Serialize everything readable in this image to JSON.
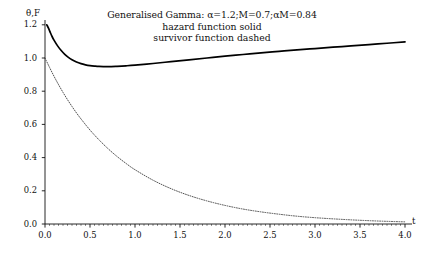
{
  "chart_data": {
    "type": "line",
    "title": "Generalised Gamma: α=1.2;M=0.7;αM=0.84",
    "subtitle_lines": [
      "hazard function solid",
      "survivor function dashed"
    ],
    "xlabel": "t",
    "ylabel": "θ,F",
    "xlim": [
      0.0,
      4.0
    ],
    "ylim": [
      0.0,
      1.2
    ],
    "grid": false,
    "legend_position": "none",
    "xticks": [
      "0.0",
      "0.5",
      "1.0",
      "1.5",
      "2.0",
      "2.5",
      "3.0",
      "3.5",
      "4.0"
    ],
    "xtick_values": [
      0.0,
      0.5,
      1.0,
      1.5,
      2.0,
      2.5,
      3.0,
      3.5,
      4.0
    ],
    "yticks": [
      "0.0",
      "0.2",
      "0.4",
      "0.6",
      "0.8",
      "1.0",
      "1.2"
    ],
    "ytick_values": [
      0.0,
      0.2,
      0.4,
      0.6,
      0.8,
      1.0,
      1.2
    ],
    "parameters": {
      "alpha": 1.2,
      "M": 0.7,
      "alphaM": 0.84
    },
    "series": [
      {
        "name": "hazard function",
        "style": "solid",
        "color": "#000000",
        "x": [
          0.02,
          0.04,
          0.06,
          0.08,
          0.1,
          0.14,
          0.18,
          0.22,
          0.26,
          0.3,
          0.35,
          0.4,
          0.45,
          0.5,
          0.55,
          0.6,
          0.7,
          0.8,
          0.9,
          1.0,
          1.2,
          1.4,
          1.6,
          1.8,
          2.0,
          2.2,
          2.4,
          2.6,
          2.8,
          3.0,
          3.2,
          3.4,
          3.6,
          3.8,
          4.0
        ],
        "y": [
          1.2,
          1.178,
          1.152,
          1.128,
          1.108,
          1.073,
          1.045,
          1.022,
          1.004,
          0.99,
          0.976,
          0.966,
          0.959,
          0.954,
          0.951,
          0.949,
          0.948,
          0.95,
          0.953,
          0.957,
          0.967,
          0.978,
          0.989,
          1.0,
          1.011,
          1.021,
          1.031,
          1.04,
          1.049,
          1.057,
          1.065,
          1.073,
          1.081,
          1.089,
          1.097
        ]
      },
      {
        "name": "survivor function",
        "style": "dashed",
        "color": "#333333",
        "x": [
          0.0,
          0.05,
          0.1,
          0.15,
          0.2,
          0.25,
          0.3,
          0.35,
          0.4,
          0.5,
          0.6,
          0.7,
          0.8,
          0.9,
          1.0,
          1.2,
          1.4,
          1.6,
          1.8,
          2.0,
          2.2,
          2.4,
          2.6,
          2.8,
          3.0,
          3.2,
          3.4,
          3.6,
          3.8,
          4.0
        ],
        "y": [
          1.0,
          0.944,
          0.89,
          0.84,
          0.793,
          0.749,
          0.708,
          0.669,
          0.633,
          0.566,
          0.507,
          0.454,
          0.407,
          0.365,
          0.327,
          0.264,
          0.213,
          0.172,
          0.139,
          0.112,
          0.09,
          0.073,
          0.059,
          0.047,
          0.038,
          0.031,
          0.025,
          0.02,
          0.016,
          0.013
        ]
      }
    ]
  },
  "axes": {
    "origin_px": {
      "x": 45,
      "y": 224
    },
    "x_unit_px": 90,
    "y_unit_px": 166.0
  }
}
